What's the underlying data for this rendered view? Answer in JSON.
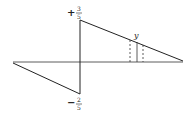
{
  "diagram": {
    "type": "sawtooth-waveform",
    "labels": {
      "top_sign": "+",
      "top_num": "3",
      "top_den": "5",
      "bottom_sign": "−",
      "bottom_num": "2",
      "bottom_den": "5",
      "marker": "y"
    },
    "values": {
      "max": "+3/5",
      "min": "-2/5"
    },
    "colors": {
      "line": "#222222",
      "background": "#ffffff"
    }
  }
}
